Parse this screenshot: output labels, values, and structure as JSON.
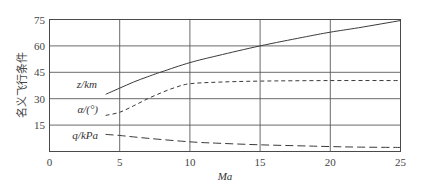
{
  "chart_data": {
    "type": "line",
    "title": "",
    "xlabel": "Ma",
    "ylabel": "名义飞行条件",
    "xlim": [
      0,
      25
    ],
    "ylim": [
      0,
      75
    ],
    "x_ticks": [
      0,
      5,
      10,
      15,
      20,
      25
    ],
    "y_ticks": [
      15,
      30,
      45,
      60,
      75
    ],
    "grid": true,
    "legend": "inline labels at left of curves",
    "series": [
      {
        "name": "z/km",
        "style": "solid",
        "x": [
          4,
          5,
          6,
          7,
          8,
          10,
          12,
          15,
          18,
          20,
          22,
          25
        ],
        "y": [
          32.5,
          36,
          39.5,
          42.5,
          45.3,
          50.5,
          54.5,
          60,
          64.8,
          67.8,
          70.3,
          74.4
        ]
      },
      {
        "name": "α/(°)",
        "style": "dashed",
        "x": [
          4,
          5,
          6,
          7,
          8,
          9,
          10,
          12,
          15,
          20,
          25
        ],
        "y": [
          20.5,
          22.3,
          26,
          30,
          33.5,
          36.5,
          38.5,
          39.4,
          40,
          40.3,
          40.3
        ]
      },
      {
        "name": "q/kPa",
        "style": "long-dashed",
        "x": [
          4,
          5,
          7,
          10,
          12,
          15,
          18,
          20,
          22,
          25
        ],
        "y": [
          9.7,
          9.1,
          7.5,
          5.5,
          4.7,
          3.8,
          3.2,
          2.8,
          2.5,
          2.3
        ]
      }
    ]
  },
  "labels": {
    "ylabel": "名义飞行条件",
    "xlabel": "Ma",
    "series_z": "z/km",
    "series_alpha": "α/(°)",
    "series_q": "q/kPa",
    "xticks": [
      "0",
      "5",
      "10",
      "15",
      "20",
      "25"
    ],
    "yticks": [
      "15",
      "30",
      "45",
      "60",
      "75"
    ]
  }
}
